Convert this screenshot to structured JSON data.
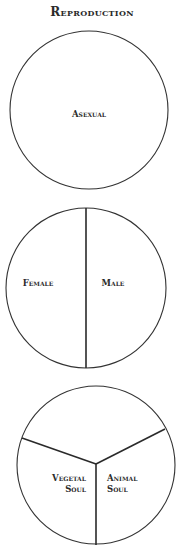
{
  "title": "Reproduction",
  "diagrams": [
    {
      "id": "asexual",
      "labels": [
        "Asexual"
      ]
    },
    {
      "id": "sexual",
      "labels": [
        "Female",
        "Male"
      ]
    },
    {
      "id": "soul",
      "labels": [
        "Vegetal",
        "Soul",
        "Animal",
        "Soul"
      ]
    }
  ],
  "colors": {
    "ink": "#2a2a2a",
    "background": "#ffffff"
  }
}
